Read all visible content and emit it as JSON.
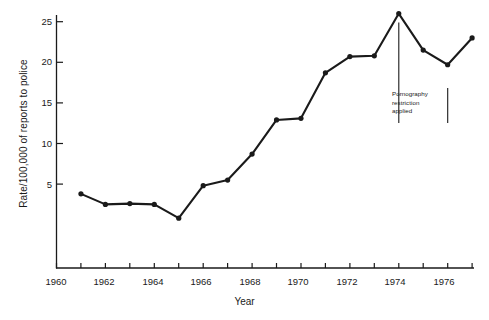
{
  "chart_data": {
    "type": "line",
    "title": "",
    "xlabel": "Year",
    "ylabel": "Rate/100,000 of reports to police",
    "xlim": [
      1960,
      1977
    ],
    "ylim": [
      -5.4,
      26.8
    ],
    "grid": false,
    "legend": null,
    "x": [
      1961,
      1962,
      1963,
      1964,
      1965,
      1966,
      1967,
      1968,
      1969,
      1970,
      1971,
      1972,
      1973,
      1974,
      1975,
      1976,
      1977
    ],
    "values": [
      3.8,
      2.5,
      2.6,
      2.5,
      0.8,
      4.8,
      5.5,
      8.7,
      12.9,
      13.1,
      18.7,
      20.7,
      20.8,
      26.0,
      21.5,
      19.7,
      23.0
    ],
    "series": [
      {
        "name": "Rate of reports to police",
        "values": [
          3.8,
          2.5,
          2.6,
          2.5,
          0.8,
          4.8,
          5.5,
          8.7,
          12.9,
          13.1,
          18.7,
          20.7,
          20.8,
          26.0,
          21.5,
          19.7,
          23.0
        ]
      }
    ],
    "xticks": [
      1960,
      1961,
      1962,
      1963,
      1964,
      1965,
      1966,
      1967,
      1968,
      1969,
      1970,
      1971,
      1972,
      1973,
      1974,
      1975,
      1976,
      1977
    ],
    "xtick_labels": [
      "1960",
      "",
      "1962",
      "",
      "1964",
      "",
      "1966",
      "",
      "1968",
      "",
      "1970",
      "",
      "1972",
      "",
      "1974",
      "",
      "1976",
      ""
    ],
    "xtick_labels_shown": [
      "1960",
      "1962",
      "1964",
      "1966",
      "1968",
      "1970",
      "1972",
      "1974",
      "1976"
    ],
    "yticks": [
      5,
      10,
      15,
      20,
      25
    ],
    "ytick_labels": [
      "5",
      "10",
      "15",
      "20",
      "25"
    ],
    "annotations": [
      {
        "text_lines": [
          "Pornography",
          "restriction",
          "applied"
        ],
        "text": "Pornography restriction applied",
        "at_year": 1974,
        "marker_years": [
          1974,
          1976
        ]
      }
    ],
    "colors": {
      "line": "#1a1a1a",
      "marker": "#1a1a1a",
      "axis": "#1a1a1a",
      "background": "#ffffff"
    }
  }
}
